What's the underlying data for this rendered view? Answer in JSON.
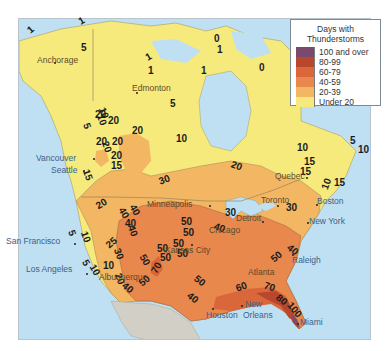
{
  "legend": {
    "title_line1": "Days with",
    "title_line2": "Thunderstorms",
    "items": [
      {
        "label": "100 and over",
        "color": "#7a4a6e"
      },
      {
        "label": "80-99",
        "color": "#b8472e"
      },
      {
        "label": "60-79",
        "color": "#d9673a"
      },
      {
        "label": "40-59",
        "color": "#e8884c"
      },
      {
        "label": "20-39",
        "color": "#f3b763"
      },
      {
        "label": "Under 20",
        "color": "#f7ea7c"
      }
    ]
  },
  "colors": {
    "water": "#bfe0f3",
    "mexico": "#d2cfc6",
    "under20": "#f7ea7c",
    "c20_39": "#f3b763",
    "c40_59": "#e8884c",
    "c60_79": "#d9673a",
    "c80_99": "#b8472e",
    "c100": "#7a4a6e",
    "border": "#8a7a55"
  },
  "cities": [
    {
      "name": "Anchorage",
      "x": 37,
      "y": 56,
      "dx": 54,
      "dy": 62
    },
    {
      "name": "Edmonton",
      "x": 132,
      "y": 84,
      "dx": 136,
      "dy": 92
    },
    {
      "name": "Vancouver",
      "x": 36,
      "y": 154,
      "dx": 93,
      "dy": 158
    },
    {
      "name": "Seattle",
      "x": 51,
      "y": 166,
      "dx": 83,
      "dy": 170
    },
    {
      "name": "San Francisco",
      "x": 6,
      "y": 237,
      "dx": 74,
      "dy": 243
    },
    {
      "name": "Los Angeles",
      "x": 26,
      "y": 265,
      "dx": 86,
      "dy": 273
    },
    {
      "name": "Albuquerque",
      "x": 99,
      "y": 273,
      "dx": 0,
      "dy": 0
    },
    {
      "name": "Kansas City",
      "x": 165,
      "y": 246,
      "dx": 191,
      "dy": 244
    },
    {
      "name": "Minneapolis",
      "x": 147,
      "y": 200,
      "dx": 209,
      "dy": 205
    },
    {
      "name": "Chicago",
      "x": 209,
      "y": 226,
      "dx": 0,
      "dy": 0
    },
    {
      "name": "Detroit",
      "x": 236,
      "y": 214,
      "dx": 262,
      "dy": 221
    },
    {
      "name": "Toronto",
      "x": 261,
      "y": 196,
      "dx": 277,
      "dy": 205
    },
    {
      "name": "Quebec",
      "x": 275,
      "y": 172,
      "dx": 306,
      "dy": 177
    },
    {
      "name": "Boston",
      "x": 317,
      "y": 197,
      "dx": 316,
      "dy": 204
    },
    {
      "name": "New York",
      "x": 309,
      "y": 217,
      "dx": 307,
      "dy": 222
    },
    {
      "name": "Raleigh",
      "x": 292,
      "y": 256,
      "dx": 292,
      "dy": 254
    },
    {
      "name": "Atlanta",
      "x": 248,
      "y": 268,
      "dx": 0,
      "dy": 0
    },
    {
      "name": "New",
      "x": 245,
      "y": 300,
      "dx": 241,
      "dy": 305
    },
    {
      "name": "Orleans",
      "x": 243,
      "y": 311,
      "dx": 0,
      "dy": 0
    },
    {
      "name": "Houston",
      "x": 206,
      "y": 311,
      "dx": 212,
      "dy": 308
    },
    {
      "name": "Miami",
      "x": 300,
      "y": 318,
      "dx": 297,
      "dy": 323
    }
  ],
  "isolines": [
    {
      "t": "1",
      "x": 32,
      "y": 30,
      "r": -40
    },
    {
      "t": "1",
      "x": 83,
      "y": 21,
      "r": -30
    },
    {
      "t": "5",
      "x": 85,
      "y": 48,
      "r": 0
    },
    {
      "t": "1",
      "x": 152,
      "y": 71,
      "r": 0
    },
    {
      "t": "1",
      "x": 205,
      "y": 71,
      "r": 0
    },
    {
      "t": "1",
      "x": 150,
      "y": 57,
      "r": -30
    },
    {
      "t": "1",
      "x": 221,
      "y": 50,
      "r": 0
    },
    {
      "t": "0",
      "x": 218,
      "y": 39,
      "r": 0
    },
    {
      "t": "0",
      "x": 263,
      "y": 68,
      "r": 0
    },
    {
      "t": "5",
      "x": 174,
      "y": 104,
      "r": 0
    },
    {
      "t": "10",
      "x": 180,
      "y": 139,
      "r": 0
    },
    {
      "t": "20",
      "x": 136,
      "y": 131,
      "r": 0
    },
    {
      "t": "20",
      "x": 100,
      "y": 142,
      "r": 0
    },
    {
      "t": "10",
      "x": 100,
      "y": 120,
      "r": 70
    },
    {
      "t": "5",
      "x": 88,
      "y": 126,
      "r": 70
    },
    {
      "t": "20",
      "x": 112,
      "y": 121,
      "r": 0
    },
    {
      "t": "20",
      "x": 99,
      "y": 115,
      "r": 0
    },
    {
      "t": "20",
      "x": 116,
      "y": 142,
      "r": 0
    },
    {
      "t": "20",
      "x": 105,
      "y": 147,
      "r": 70
    },
    {
      "t": "20",
      "x": 115,
      "y": 156,
      "r": 0
    },
    {
      "t": "15",
      "x": 115,
      "y": 166,
      "r": 0
    },
    {
      "t": "15",
      "x": 86,
      "y": 175,
      "r": 70
    },
    {
      "t": "10",
      "x": 102,
      "y": 113,
      "r": 70
    },
    {
      "t": "20",
      "x": 100,
      "y": 204,
      "r": -30
    },
    {
      "t": "40",
      "x": 122,
      "y": 213,
      "r": 60
    },
    {
      "t": "40",
      "x": 131,
      "y": 231,
      "r": 70
    },
    {
      "t": "40",
      "x": 129,
      "y": 224,
      "r": 0
    },
    {
      "t": "25",
      "x": 110,
      "y": 243,
      "r": -40
    },
    {
      "t": "40",
      "x": 133,
      "y": 210,
      "r": 60
    },
    {
      "t": "30",
      "x": 163,
      "y": 180,
      "r": -20
    },
    {
      "t": "20",
      "x": 235,
      "y": 166,
      "r": 20
    },
    {
      "t": "30",
      "x": 229,
      "y": 213,
      "r": 0
    },
    {
      "t": "40",
      "x": 218,
      "y": 228,
      "r": 20
    },
    {
      "t": "50",
      "x": 187,
      "y": 233,
      "r": 0
    },
    {
      "t": "50",
      "x": 177,
      "y": 244,
      "r": 0
    },
    {
      "t": "50",
      "x": 181,
      "y": 254,
      "r": 0
    },
    {
      "t": "50",
      "x": 185,
      "y": 222,
      "r": 0
    },
    {
      "t": "10",
      "x": 362,
      "y": 150,
      "r": 0
    },
    {
      "t": "10",
      "x": 301,
      "y": 148,
      "r": 0
    },
    {
      "t": "15",
      "x": 308,
      "y": 162,
      "r": 0
    },
    {
      "t": "15",
      "x": 304,
      "y": 172,
      "r": 0
    },
    {
      "t": "15",
      "x": 338,
      "y": 183,
      "r": 0
    },
    {
      "t": "10",
      "x": 325,
      "y": 184,
      "r": -70
    },
    {
      "t": "5",
      "x": 354,
      "y": 141,
      "r": 0
    },
    {
      "t": "30",
      "x": 290,
      "y": 208,
      "r": 0
    },
    {
      "t": "40",
      "x": 291,
      "y": 250,
      "r": 40
    },
    {
      "t": "50",
      "x": 275,
      "y": 257,
      "r": -40
    },
    {
      "t": "50",
      "x": 198,
      "y": 281,
      "r": 40
    },
    {
      "t": "40",
      "x": 191,
      "y": 298,
      "r": 40
    },
    {
      "t": "60",
      "x": 240,
      "y": 287,
      "r": -20
    },
    {
      "t": "70",
      "x": 268,
      "y": 287,
      "r": 20
    },
    {
      "t": "80",
      "x": 280,
      "y": 300,
      "r": 40
    },
    {
      "t": "100",
      "x": 290,
      "y": 310,
      "r": 50
    },
    {
      "t": "10",
      "x": 84,
      "y": 237,
      "r": 70
    },
    {
      "t": "5",
      "x": 73,
      "y": 233,
      "r": 70
    },
    {
      "t": "5",
      "x": 87,
      "y": 263,
      "r": 60
    },
    {
      "t": "10",
      "x": 93,
      "y": 270,
      "r": 60
    },
    {
      "t": "10",
      "x": 107,
      "y": 266,
      "r": 0
    },
    {
      "t": "20",
      "x": 118,
      "y": 279,
      "r": 70
    },
    {
      "t": "30",
      "x": 117,
      "y": 254,
      "r": 70
    },
    {
      "t": "40",
      "x": 126,
      "y": 288,
      "r": 40
    },
    {
      "t": "50",
      "x": 143,
      "y": 281,
      "r": -40
    },
    {
      "t": "50",
      "x": 143,
      "y": 260,
      "r": 60
    },
    {
      "t": "70",
      "x": 155,
      "y": 268,
      "r": -60
    },
    {
      "t": "50",
      "x": 161,
      "y": 249,
      "r": 0
    },
    {
      "t": "50",
      "x": 164,
      "y": 258,
      "r": 0
    }
  ]
}
